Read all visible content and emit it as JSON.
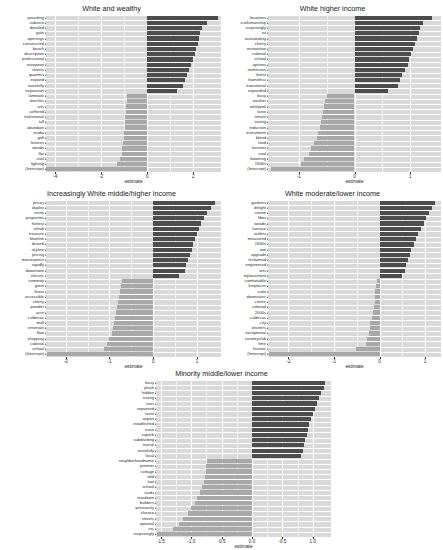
{
  "figure": {
    "type": "faceted-coefficient-bar-chart",
    "axis_title": "estimate",
    "colors": {
      "panel_background": "#d9d9d9",
      "gridline": "#ffffff",
      "positive_bar": "#4d4d4d",
      "negative_bar": "#a8a8a8",
      "text": "#1a1a1a"
    }
  },
  "chart_data": [
    {
      "type": "bar",
      "orientation": "horizontal",
      "title": "White and wealthy",
      "xlabel": "estimate",
      "ylabel": "",
      "xlim": [
        -4.4,
        3.2
      ],
      "xticks": [
        -4,
        -2,
        0,
        2
      ],
      "xticklabels": [
        "-4",
        "-2",
        "0",
        "2"
      ],
      "grid": true,
      "categories": [
        "providing",
        "subzero",
        "detailed",
        "gate",
        "openings",
        "constructed",
        "beach",
        "description",
        "professional",
        "european",
        "sheets",
        "quarters",
        "expand",
        "tastefully",
        "expansion",
        "laminate",
        "touches",
        "arts",
        "coffered",
        "transitional",
        "tall",
        "abundant",
        "studio",
        "golf",
        "fixtures",
        "woods",
        "flat",
        "cool",
        "lighting",
        "(Intercept)"
      ],
      "values": [
        3.05,
        2.6,
        2.38,
        2.3,
        2.25,
        2.2,
        2.1,
        2.05,
        1.98,
        1.9,
        1.8,
        1.72,
        1.65,
        1.55,
        1.3,
        -0.9,
        -0.9,
        -0.92,
        -0.93,
        -0.95,
        -0.97,
        -0.98,
        -1.0,
        -1.02,
        -1.05,
        -1.08,
        -1.12,
        -1.18,
        -1.3,
        -4.4
      ]
    },
    {
      "type": "bar",
      "orientation": "horizontal",
      "title": "White higher income",
      "xlabel": "estimate",
      "ylabel": "",
      "xlim": [
        -1.55,
        1.55
      ],
      "xticks": [
        -1,
        0,
        1
      ],
      "xticklabels": [
        "-1",
        "0",
        "1"
      ],
      "grid": true,
      "categories": [
        "locations",
        "craftsmanship",
        "surprisingly",
        "ez",
        "outstanding",
        "cherry",
        "restoration",
        "colonial",
        "school",
        "options",
        "numerous",
        "finest",
        "frameless",
        "transitional",
        "expanded",
        "busy",
        "washer",
        "whirlpool",
        "taste",
        "tenant",
        "eating",
        "reduction",
        "investment",
        "blend",
        "land",
        "investor",
        "coal",
        "booming",
        "1940s",
        "(Intercept)"
      ],
      "values": [
        1.38,
        1.22,
        1.18,
        1.15,
        1.12,
        1.08,
        1.05,
        1.02,
        0.98,
        0.95,
        0.9,
        0.85,
        0.82,
        0.78,
        0.6,
        -0.5,
        -0.52,
        -0.54,
        -0.56,
        -0.58,
        -0.6,
        -0.62,
        -0.65,
        -0.68,
        -0.72,
        -0.78,
        -0.82,
        -0.9,
        -0.95,
        -1.5
      ]
    },
    {
      "type": "bar",
      "orientation": "horizontal",
      "title": "Increasingly White middle/higher income",
      "xlabel": "estimate",
      "ylabel": "",
      "xlim": [
        -2.45,
        1.55
      ],
      "xticks": [
        -2,
        -1,
        0,
        1
      ],
      "xticklabels": [
        "-2",
        "-1",
        "0",
        "1"
      ],
      "grid": true,
      "categories": [
        "prices",
        "duplex",
        "niche",
        "properties",
        "hottest",
        "rehab",
        "treasure",
        "blueline",
        "disturb",
        "skyline",
        "pricing",
        "masterpiece",
        "rapidly",
        "downtown",
        "electric",
        "common",
        "greet",
        "finest",
        "accessible",
        "cherry",
        "powder",
        "acre",
        "culdesac",
        "mall",
        "entertain",
        "flow",
        "shopping",
        "colonial",
        "school",
        "(Intercept)"
      ],
      "values": [
        1.42,
        1.32,
        1.22,
        1.15,
        1.1,
        1.05,
        1.0,
        0.96,
        0.92,
        0.88,
        0.84,
        0.8,
        0.76,
        0.72,
        0.6,
        -0.72,
        -0.74,
        -0.76,
        -0.78,
        -0.8,
        -0.82,
        -0.85,
        -0.88,
        -0.9,
        -0.92,
        -0.95,
        -1.0,
        -1.05,
        -1.12,
        -2.42
      ]
    },
    {
      "type": "bar",
      "orientation": "horizontal",
      "title": "White moderate/lower income",
      "xlabel": "estimate",
      "ylabel": "",
      "xlim": [
        -2.45,
        1.35
      ],
      "xticks": [
        -2,
        -1,
        0,
        1
      ],
      "xticklabels": [
        "-2",
        "-1",
        "0",
        "1"
      ],
      "grid": true,
      "categories": [
        "gardens",
        "delight",
        "steam",
        "fiber",
        "woods",
        "furnace",
        "outlets",
        "measured",
        "1940s",
        "unit",
        "upgrade",
        "reclaimed",
        "engineered",
        "arts",
        "replacement",
        "comfortable",
        "fireplaces",
        "suite",
        "downstairs",
        "centre",
        "colonial",
        "2000s",
        "culdesac",
        "city",
        "shutters",
        "exceptional",
        "countryclub",
        "lime",
        "historic",
        "(Intercept)"
      ],
      "values": [
        1.22,
        1.15,
        1.08,
        1.02,
        0.98,
        0.92,
        0.85,
        0.8,
        0.75,
        0.7,
        0.66,
        0.62,
        0.58,
        0.55,
        0.5,
        -0.06,
        -0.08,
        -0.09,
        -0.1,
        -0.11,
        -0.12,
        -0.14,
        -0.16,
        -0.2,
        -0.22,
        -0.24,
        -0.28,
        -0.3,
        -0.52,
        -2.42
      ]
    },
    {
      "type": "bar",
      "orientation": "horizontal",
      "title": "Minority middle/lower income",
      "xlabel": "estimate",
      "ylabel": "",
      "xlim": [
        -1.58,
        1.3
      ],
      "xticks": [
        -1.5,
        -1.0,
        -0.5,
        0.0,
        0.5,
        1.0
      ],
      "xticklabels": [
        "-1.5",
        "-1.0",
        "-0.5",
        "0.0",
        "-0.5",
        "1.0"
      ],
      "grid": true,
      "categories": [
        "busy",
        "plush",
        "hidden",
        "eating",
        "river",
        "repainted",
        "taste",
        "airport",
        "established",
        "ease",
        "superb",
        "subdividing",
        "transit",
        "tastefully",
        "local",
        "neighborhoodname",
        "premier",
        "cottage",
        "told",
        "law",
        "school",
        "studs",
        "teardown",
        "builders",
        "previously",
        "chance",
        "streets",
        "optional",
        "rec",
        "surprisingly"
      ],
      "values": [
        1.2,
        1.18,
        1.14,
        1.1,
        1.07,
        1.04,
        1.0,
        0.97,
        0.94,
        0.92,
        0.9,
        0.88,
        0.86,
        0.84,
        0.8,
        -0.74,
        -0.75,
        -0.76,
        -0.77,
        -0.79,
        -0.82,
        -0.86,
        -0.9,
        -0.94,
        -1.0,
        -1.06,
        -1.14,
        -1.2,
        -1.3,
        -1.56
      ]
    }
  ]
}
